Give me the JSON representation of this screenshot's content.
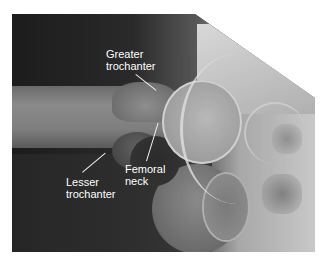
{
  "figure": {
    "type": "hip radiograph",
    "labels": [
      {
        "id": "greater-trochanter",
        "line1": "Greater",
        "line2": "trochanter"
      },
      {
        "id": "lesser-trochanter",
        "line1": "Lesser",
        "line2": "trochanter"
      },
      {
        "id": "femoral-neck",
        "line1": "Femoral",
        "line2": "neck"
      }
    ],
    "label_color": "#ffffff",
    "background_color": "#ffffff"
  }
}
